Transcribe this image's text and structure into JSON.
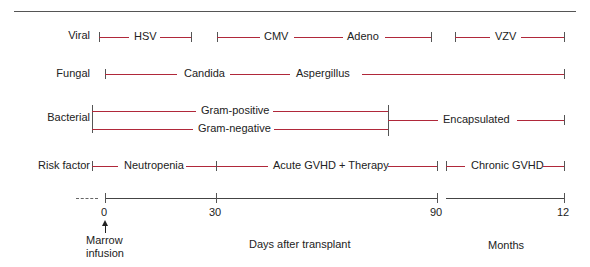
{
  "rows": {
    "viral": "Viral",
    "fungal": "Fungal",
    "bacterial": "Bacterial",
    "risk": "Risk factor"
  },
  "viral": {
    "hsv": "HSV",
    "cmv": "CMV",
    "adeno": "Adeno",
    "vzv": "VZV"
  },
  "fungal": {
    "candida": "Candida",
    "aspergillus": "Aspergillus"
  },
  "bacterial": {
    "gram_positive": "Gram-positive",
    "gram_negative": "Gram-negative",
    "encapsulated": "Encapsulated"
  },
  "risk": {
    "neutropenia": "Neutropenia",
    "acute": "Acute GVHD + Therapy",
    "chronic": "Chronic GVHD"
  },
  "axis": {
    "ticks": [
      "0",
      "30",
      "90",
      "12"
    ],
    "marrow_line1": "Marrow",
    "marrow_line2": "infusion",
    "days_label": "Days after transplant",
    "months_label": "Months"
  },
  "colors": {
    "segment": "#b0283a",
    "axis": "#444444"
  }
}
